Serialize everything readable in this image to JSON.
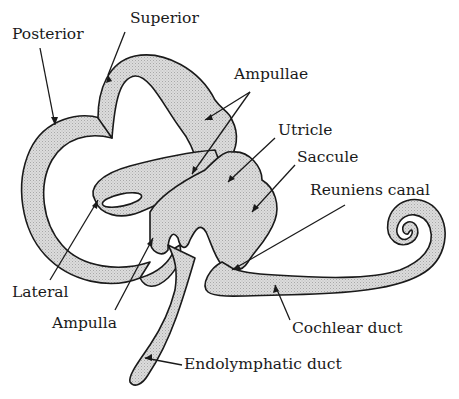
{
  "figure": {
    "colors": {
      "fill": "#d4d4d4",
      "outline": "#1a1a1a",
      "background": "#ffffff"
    }
  },
  "labels": {
    "posterior": "Posterior",
    "superior": "Superior",
    "ampullae": "Ampullae",
    "utricle": "Utricle",
    "saccule": "Saccule",
    "reuniens_canal": "Reuniens canal",
    "lateral": "Lateral",
    "ampulla": "Ampulla",
    "cochlear_duct": "Cochlear duct",
    "endolymphatic_duct": "Endolymphatic duct"
  }
}
